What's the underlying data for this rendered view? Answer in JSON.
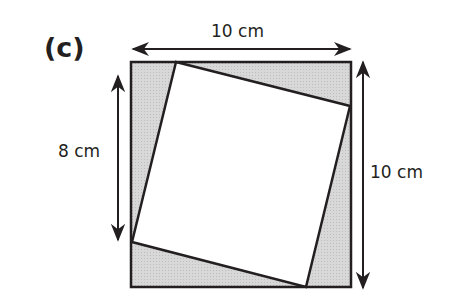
{
  "figure": {
    "part_label": "(c)",
    "labels": {
      "top_width": "10 cm",
      "left_height": "8 cm",
      "right_height": "10 cm"
    },
    "colors": {
      "outline": "#231f20",
      "shaded": "#d4d4d4",
      "inner_square": "#ffffff"
    },
    "outer_square": {
      "x1": 131,
      "y1": 62,
      "x2": 351,
      "y2": 287
    },
    "inner_square_corners": [
      [
        176,
        62
      ],
      [
        350,
        106
      ],
      [
        306,
        287
      ],
      [
        132,
        242
      ]
    ]
  }
}
